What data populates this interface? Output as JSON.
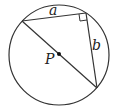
{
  "diagram": {
    "type": "geometry",
    "circle": {
      "cx": 59,
      "cy": 55,
      "r": 50,
      "stroke": "#333333"
    },
    "center_label": "P",
    "vertices": {
      "left": {
        "x": 22,
        "y": 21
      },
      "right_angle": {
        "x": 86,
        "y": 13
      },
      "bottom": {
        "x": 97,
        "y": 88
      }
    },
    "side_labels": {
      "a": "a",
      "b": "b"
    },
    "colors": {
      "stroke": "#333333",
      "label": "#222222",
      "background": "#ffffff"
    }
  }
}
